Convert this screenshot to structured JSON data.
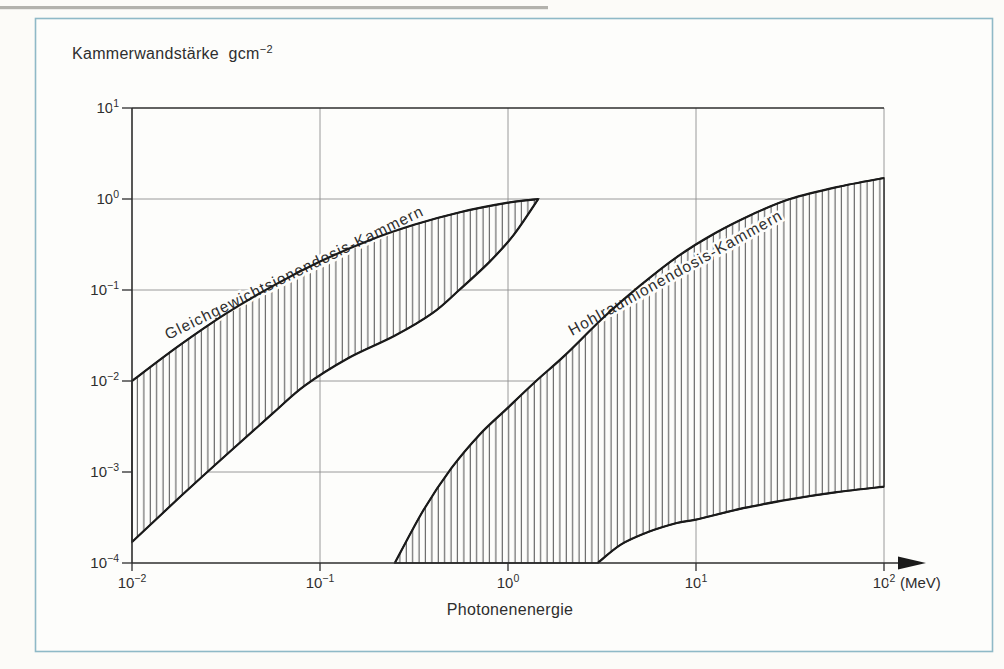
{
  "colors": {
    "ink": "#2e2e2e",
    "curve": "#1a1a1a",
    "grid": "#8f8f8f",
    "hatch": "#2e2e2e",
    "frame_blue": "#8fb9c7",
    "paper": "#fdfdfb",
    "scan_line": "#a6a5a0"
  },
  "figure": {
    "title_main": "Kammerwandstärke  gcm",
    "title_sup": "−2",
    "xlabel": "Photonenenergie",
    "x_unit": "(MeV)"
  },
  "chart_data": {
    "type": "area",
    "scale": "log-log",
    "xlabel": "Photonenenergie",
    "ylabel": "Kammerwandstärke",
    "x_unit": "MeV",
    "xlim": [
      0.01,
      100
    ],
    "ylim": [
      0.0001,
      10
    ],
    "grid": true,
    "legend": "labels-along-curves",
    "x_tick_exponents": [
      -2,
      -1,
      0,
      1,
      2
    ],
    "y_tick_exponents": [
      1,
      0,
      -1,
      -2,
      -3,
      -4
    ],
    "bands": [
      {
        "name": "Gleichgewichtsionendosis-Kammern",
        "upper": [
          [
            0.01,
            0.01
          ],
          [
            0.0178,
            0.0245
          ],
          [
            0.0316,
            0.055
          ],
          [
            0.0562,
            0.111
          ],
          [
            0.1,
            0.205
          ],
          [
            0.178,
            0.344
          ],
          [
            0.316,
            0.52
          ],
          [
            0.562,
            0.72
          ],
          [
            1.0,
            0.91
          ],
          [
            1.45,
            1.0
          ]
        ],
        "lower": [
          [
            0.01,
            0.00017
          ],
          [
            0.0178,
            0.00052
          ],
          [
            0.033,
            0.00166
          ],
          [
            0.056,
            0.0044
          ],
          [
            0.083,
            0.0089
          ],
          [
            0.141,
            0.0178
          ],
          [
            0.251,
            0.0316
          ],
          [
            0.398,
            0.056
          ],
          [
            0.55,
            0.1
          ],
          [
            0.79,
            0.2
          ],
          [
            1.07,
            0.4
          ],
          [
            1.45,
            1.0
          ]
        ]
      },
      {
        "name": "Hohlraumionendosis-Kammern",
        "upper": [
          [
            0.25,
            0.0001
          ],
          [
            0.355,
            0.00038
          ],
          [
            0.5,
            0.0011
          ],
          [
            0.71,
            0.0026
          ],
          [
            1.0,
            0.0051
          ],
          [
            1.41,
            0.01
          ],
          [
            2.0,
            0.019
          ],
          [
            3.16,
            0.048
          ],
          [
            5.0,
            0.11
          ],
          [
            7.9,
            0.23
          ],
          [
            12.6,
            0.42
          ],
          [
            20,
            0.68
          ],
          [
            31.6,
            1.0
          ],
          [
            56,
            1.35
          ],
          [
            100,
            1.7
          ]
        ],
        "lower": [
          [
            3.0,
            0.0001
          ],
          [
            4.0,
            0.00016
          ],
          [
            5.6,
            0.00022
          ],
          [
            7.9,
            0.000275
          ],
          [
            10,
            0.0003
          ],
          [
            17.8,
            0.0004
          ],
          [
            31.6,
            0.0005
          ],
          [
            56,
            0.0006
          ],
          [
            100,
            0.00069
          ]
        ]
      }
    ]
  }
}
